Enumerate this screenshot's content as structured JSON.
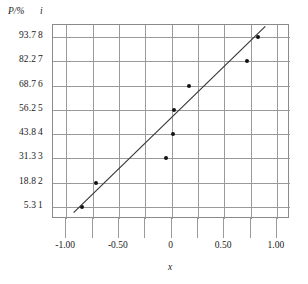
{
  "axes": {
    "left_header": "P/%",
    "right_header": "i",
    "x_axis_title": "x",
    "y_rows": [
      {
        "p": "93.7",
        "i": "8"
      },
      {
        "p": "82.2",
        "i": "7"
      },
      {
        "p": "68.7",
        "i": "6"
      },
      {
        "p": "56.2",
        "i": "5"
      },
      {
        "p": "43.8",
        "i": "4"
      },
      {
        "p": "31.3",
        "i": "3"
      },
      {
        "p": "18.8",
        "i": "2"
      },
      {
        "p": "5.3",
        "i": "1"
      }
    ],
    "x_ticklabels": [
      "-1.00",
      "-0.50",
      "0",
      "0.50",
      "1.00"
    ]
  },
  "colors": {
    "grid": "#9a9a9a",
    "frame": "#8a8a8a",
    "point": "#111111",
    "line": "#333333",
    "text": "#1a1a1a",
    "background": "#ffffff"
  },
  "chart_data": {
    "type": "scatter",
    "title": "",
    "xlabel": "x",
    "ylabel": "P/%",
    "ylabel_secondary": "i",
    "xlim": [
      -1.125,
      1.125
    ],
    "ylim": [
      0.5,
      8.5
    ],
    "grid": true,
    "legend": false,
    "x_ticks": [
      -1.0,
      -0.75,
      -0.5,
      -0.25,
      0,
      0.25,
      0.5,
      0.75,
      1.0
    ],
    "x_ticklabels": [
      "-1.00",
      "",
      "-0.50",
      "",
      "0",
      "",
      "0.50",
      "",
      "1.00"
    ],
    "y_ticks": [
      1,
      2,
      3,
      4,
      5,
      6,
      7,
      8
    ],
    "y_ticklabels_P": [
      "5.3",
      "18.8",
      "31.3",
      "43.8",
      "56.2",
      "68.7",
      "82.2",
      "93.7"
    ],
    "y_ticklabels_i": [
      "1",
      "2",
      "3",
      "4",
      "5",
      "6",
      "7",
      "8"
    ],
    "points": [
      {
        "x": -0.85,
        "i": 1,
        "P": 5.3
      },
      {
        "x": -0.72,
        "i": 2,
        "P": 18.8
      },
      {
        "x": -0.05,
        "i": 3,
        "P": 31.3
      },
      {
        "x": 0.01,
        "i": 4,
        "P": 43.8
      },
      {
        "x": 0.02,
        "i": 5,
        "P": 56.2
      },
      {
        "x": 0.17,
        "i": 6,
        "P": 68.7
      },
      {
        "x": 0.72,
        "i": 7,
        "P": 82.2
      },
      {
        "x": 0.82,
        "i": 8,
        "P": 93.7
      }
    ],
    "fit_line": {
      "x1": -0.92,
      "y1": 0.72,
      "x2": 0.9,
      "y2": 8.4
    }
  }
}
